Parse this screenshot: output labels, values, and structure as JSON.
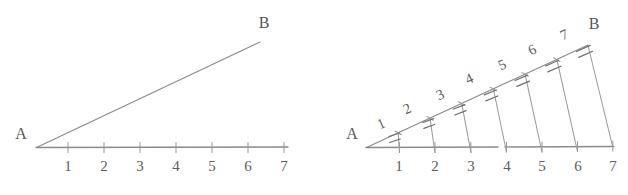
{
  "figure": {
    "background_color": "#ffffff",
    "line_color": "#8a8a8a",
    "text_color": "#5d5d5d",
    "panels": [
      {
        "id": "left-panel",
        "name": "plain-angle-diagram",
        "description": "Angle with vertex A, a ray toward B, and a horizontal number line ticked 1 through 7",
        "vertex_label": "A",
        "ray_end_label": "B",
        "baseline_tick_labels": [
          "1",
          "2",
          "3",
          "4",
          "5",
          "6",
          "7"
        ],
        "hypotenuse_tick_labels": [],
        "transversals": false,
        "hash_marks_per_segment": 0
      },
      {
        "id": "right-panel",
        "name": "subdivided-angle-diagram",
        "description": "Same angle A-B with seven transversal segments joining equal divisions on the ray to the number line, each transversal carrying a double hash mark",
        "vertex_label": "A",
        "ray_end_label": "B",
        "baseline_tick_labels": [
          "1",
          "2",
          "3",
          "4",
          "5",
          "6",
          "7"
        ],
        "hypotenuse_tick_labels": [
          "1",
          "2",
          "3",
          "4",
          "5",
          "6",
          "7"
        ],
        "transversals": true,
        "hash_marks_per_segment": 2
      }
    ]
  }
}
